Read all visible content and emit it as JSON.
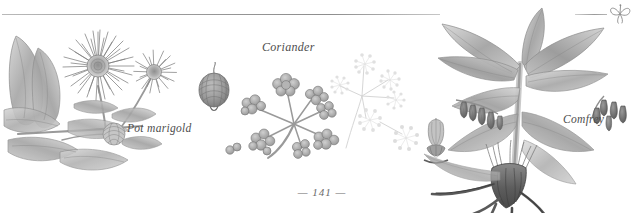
{
  "page": {
    "background_color": "#ffffff",
    "ink_color": "#4e4e4e",
    "folio": "— 141 —",
    "folio_number": "141"
  },
  "header": {
    "rule_present": true,
    "ornament_icon": "leaf-ornament-icon"
  },
  "plates": [
    {
      "id": "pot-marigold",
      "label": "Pot marigold",
      "icon": "pot-marigold-illustration-icon",
      "parts": [
        "flower head",
        "side bloom",
        "seed head",
        "leaves",
        "stem"
      ]
    },
    {
      "id": "coriander",
      "label": "Coriander",
      "icon": "coriander-illustration-icon",
      "parts": [
        "seed",
        "fruiting umbel",
        "flowering umbel"
      ]
    },
    {
      "id": "comfrey",
      "label": "Comfrey",
      "icon": "comfrey-illustration-icon",
      "parts": [
        "leaves",
        "bell flowers",
        "single flower study",
        "root"
      ]
    }
  ]
}
